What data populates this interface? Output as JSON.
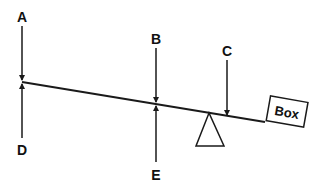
{
  "diagram": {
    "title": "",
    "type": "lever / seesaw force diagram",
    "labels": {
      "A": "A",
      "B": "B",
      "C": "C",
      "D": "D",
      "E": "E",
      "box": "Box"
    },
    "colors": {
      "stroke": "#1a1a1a",
      "background": "#ffffff"
    }
  }
}
